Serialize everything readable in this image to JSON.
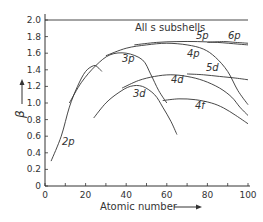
{
  "chart_data": {
    "type": "line",
    "title": "",
    "xlabel": "Atomic number",
    "ylabel": "β",
    "xlim": [
      0,
      100
    ],
    "ylim": [
      0,
      2.0
    ],
    "x_ticks": [
      "0",
      "20",
      "40",
      "60",
      "80",
      "100"
    ],
    "y_ticks": [
      "0",
      "0.2",
      "0.4",
      "0.6",
      "0.8",
      "1.0",
      "1.2",
      "1.4",
      "1.6",
      "1.8",
      "2.0"
    ],
    "grid": false,
    "legend": "none (inline curve labels)",
    "series": [
      {
        "name": "All s subshells",
        "x": [
          0,
          100
        ],
        "y": [
          2.0,
          2.0
        ]
      },
      {
        "name": "2p",
        "x": [
          3,
          8,
          12,
          16,
          20,
          24,
          26,
          28
        ],
        "y": [
          0.3,
          0.6,
          0.95,
          1.2,
          1.38,
          1.45,
          1.43,
          1.38
        ]
      },
      {
        "name": "3p",
        "x": [
          12,
          18,
          25,
          32,
          40,
          48,
          52,
          56,
          60
        ],
        "y": [
          1.0,
          1.25,
          1.45,
          1.58,
          1.6,
          1.52,
          1.35,
          1.15,
          1.0
        ]
      },
      {
        "name": "3d",
        "x": [
          24,
          30,
          36,
          42,
          48,
          54,
          58,
          62,
          65
        ],
        "y": [
          0.82,
          1.0,
          1.12,
          1.2,
          1.2,
          1.1,
          0.95,
          0.78,
          0.62
        ]
      },
      {
        "name": "4p",
        "x": [
          30,
          40,
          50,
          60,
          70,
          78,
          84,
          90,
          95,
          100
        ],
        "y": [
          1.57,
          1.66,
          1.7,
          1.72,
          1.7,
          1.65,
          1.55,
          1.38,
          1.15,
          0.98
        ]
      },
      {
        "name": "4d",
        "x": [
          38,
          46,
          54,
          62,
          70,
          78,
          86,
          92,
          96,
          100
        ],
        "y": [
          1.18,
          1.27,
          1.32,
          1.34,
          1.32,
          1.27,
          1.18,
          1.07,
          0.95,
          0.85
        ]
      },
      {
        "name": "5p",
        "x": [
          44,
          55,
          65,
          75,
          85,
          95,
          100
        ],
        "y": [
          1.7,
          1.73,
          1.74,
          1.74,
          1.73,
          1.71,
          1.7
        ]
      },
      {
        "name": "6p",
        "x": [
          80,
          88,
          94,
          100
        ],
        "y": [
          1.73,
          1.74,
          1.73,
          1.72
        ]
      },
      {
        "name": "5d",
        "x": [
          70,
          78,
          86,
          94,
          100
        ],
        "y": [
          1.35,
          1.34,
          1.32,
          1.3,
          1.28
        ]
      },
      {
        "name": "4f",
        "x": [
          58,
          66,
          74,
          82,
          88,
          94,
          100
        ],
        "y": [
          1.03,
          1.05,
          1.04,
          1.0,
          0.94,
          0.85,
          0.75
        ]
      }
    ]
  },
  "labels": {
    "s": "All s subshells",
    "p2": "2p",
    "p3": "3p",
    "p4": "4p",
    "p5": "5p",
    "p6": "6p",
    "d3": "3d",
    "d4": "4d",
    "d5": "5d",
    "f4": "4f",
    "xlabel": "Atomic number",
    "ylabel": "β"
  },
  "ticks": {
    "x": [
      "0",
      "20",
      "40",
      "60",
      "80",
      "100"
    ],
    "y": [
      "0",
      "0.2",
      "0.4",
      "0.6",
      "0.8",
      "1.0",
      "1.2",
      "1.4",
      "1.6",
      "1.8",
      "2.0"
    ]
  }
}
